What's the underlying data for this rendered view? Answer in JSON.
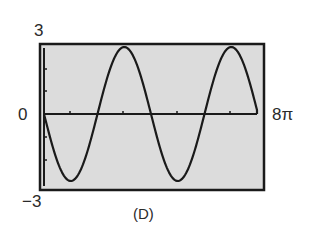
{
  "chart_data": {
    "type": "line",
    "title": "",
    "caption": "(D)",
    "xlabel": "",
    "ylabel": "",
    "x_min_label": "0",
    "x_max_label": "8π",
    "y_max_label": "3",
    "y_min_label": "−3",
    "xlim": [
      0,
      "8π"
    ],
    "ylim": [
      -3,
      3
    ],
    "grid": false,
    "x_tick_count": 4,
    "y_tick_count_each_side": 3,
    "series": [
      {
        "name": "y = -3 sin(x/2)",
        "description": "Sinusoid starting at origin going downward; amplitude 3; period ≈ 4π; two full cycles with troughs near x≈π and 5π, peaks near x≈3π and 7π",
        "x": [
          "0",
          "π",
          "2π",
          "3π",
          "4π",
          "5π",
          "6π",
          "7π",
          "≈7.7π"
        ],
        "y": [
          0,
          -3,
          0,
          3,
          0,
          -3,
          0,
          3,
          0
        ]
      }
    ],
    "colors": {
      "frame": "#1a1a1a",
      "plot_background": "#dcdcdc",
      "curve": "#1a1a1a"
    }
  },
  "labels": {
    "y_top": "3",
    "y_zero": "0",
    "y_bottom": "−3",
    "x_right": "8π",
    "caption": "(D)"
  }
}
